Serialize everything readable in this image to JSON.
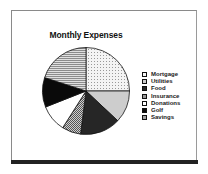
{
  "chart_data": {
    "type": "pie",
    "title": "Monthly Expenses",
    "categories": [
      "Mortgage",
      "Utilities",
      "Food",
      "Insurance",
      "Donations",
      "Golf",
      "Savings"
    ],
    "values": [
      25,
      12,
      15,
      7,
      10,
      11,
      20
    ],
    "unit": "percent (estimated from slice angles)",
    "start_angle": "12 o'clock, clockwise",
    "legend_position": "right",
    "fills": [
      "dotted",
      "light-gray",
      "dark",
      "crosshatch-gray",
      "white",
      "black",
      "horizontal-lines"
    ],
    "colors": [
      "#f2f2f2",
      "#cfcfcf",
      "#2a2a2a",
      "#a8a8a8",
      "#ffffff",
      "#0d0d0d",
      "#b8b8b8"
    ]
  },
  "legend": {
    "items": [
      {
        "label": "Mortgage"
      },
      {
        "label": "Utilities"
      },
      {
        "label": "Food"
      },
      {
        "label": "Insurance"
      },
      {
        "label": "Donations"
      },
      {
        "label": "Golf"
      },
      {
        "label": "Savings"
      }
    ]
  }
}
